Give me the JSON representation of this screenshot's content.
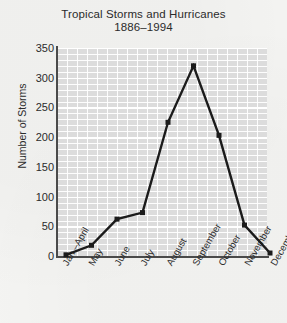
{
  "chart_data": {
    "type": "line",
    "title": "Tropical Storms and Hurricanes",
    "subtitle": "1886–1994",
    "xlabel": "",
    "ylabel": "Number of Storms",
    "categories": [
      "Jan.–April",
      "May",
      "June",
      "July",
      "August",
      "September",
      "October",
      "November",
      "December"
    ],
    "values": [
      2,
      18,
      62,
      73,
      225,
      320,
      203,
      52,
      5
    ],
    "ylim": [
      0,
      350
    ],
    "ytick_labels": [
      "350",
      "300",
      "250",
      "200",
      "150",
      "100",
      "50",
      "0"
    ],
    "ytick_values": [
      350,
      300,
      250,
      200,
      150,
      100,
      50,
      0
    ],
    "grid": true,
    "legend": "none",
    "series": [
      {
        "name": "Number of Storms",
        "values": [
          2,
          18,
          62,
          73,
          225,
          320,
          203,
          52,
          5
        ]
      }
    ]
  },
  "colors": {
    "page_background": "#f4f4f2",
    "plot_background": "#dcdcdc",
    "grid": "#ffffff",
    "line": "#1b1b1b",
    "axis": "#4a4a4a",
    "text": "#2b2b2b"
  }
}
